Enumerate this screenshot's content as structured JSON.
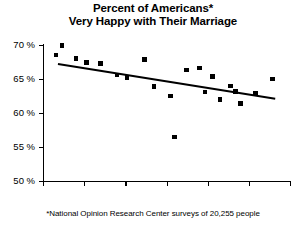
{
  "chart_data": {
    "type": "scatter",
    "title": "Percent of Americans*",
    "subtitle": "Very Happy with Their Marriage",
    "xlabel": "",
    "ylabel": "",
    "xlim": [
      1970,
      2000
    ],
    "ylim": [
      50,
      70
    ],
    "xticks": [
      1970,
      1975,
      1980,
      1985,
      1990,
      1995,
      2000
    ],
    "xtick_labels": [
      "1970",
      "1975",
      "1980",
      "1985",
      "1990",
      "1995",
      "2000"
    ],
    "yticks": [
      50,
      55,
      60,
      65,
      70
    ],
    "ytick_labels": [
      "50 %",
      "55 %",
      "60 %",
      "65 %",
      "70 %"
    ],
    "grid": false,
    "legend": null,
    "marker_color": "#000000",
    "line_color": "#000000",
    "points": [
      {
        "x": 1971.6,
        "y": 68.5
      },
      {
        "x": 1972.3,
        "y": 69.9
      },
      {
        "x": 1974.0,
        "y": 68.0
      },
      {
        "x": 1975.3,
        "y": 67.4
      },
      {
        "x": 1977.0,
        "y": 67.3
      },
      {
        "x": 1979.0,
        "y": 65.6
      },
      {
        "x": 1980.2,
        "y": 65.2
      },
      {
        "x": 1982.3,
        "y": 67.9
      },
      {
        "x": 1983.5,
        "y": 63.9
      },
      {
        "x": 1985.5,
        "y": 62.5
      },
      {
        "x": 1986.0,
        "y": 56.5
      },
      {
        "x": 1987.4,
        "y": 66.3
      },
      {
        "x": 1989.0,
        "y": 66.6
      },
      {
        "x": 1989.7,
        "y": 63.1
      },
      {
        "x": 1990.6,
        "y": 65.4
      },
      {
        "x": 1991.5,
        "y": 62.0
      },
      {
        "x": 1992.8,
        "y": 64.0
      },
      {
        "x": 1993.4,
        "y": 63.2
      },
      {
        "x": 1994.0,
        "y": 61.4
      },
      {
        "x": 1995.8,
        "y": 62.9
      },
      {
        "x": 1997.9,
        "y": 65.0
      }
    ],
    "trendline": {
      "x_start": 1971.8,
      "y_start": 67.4,
      "x_end": 1998.2,
      "y_end": 62.3
    },
    "footnote": "*National Opinion Research Center surveys of 20,255 people"
  }
}
